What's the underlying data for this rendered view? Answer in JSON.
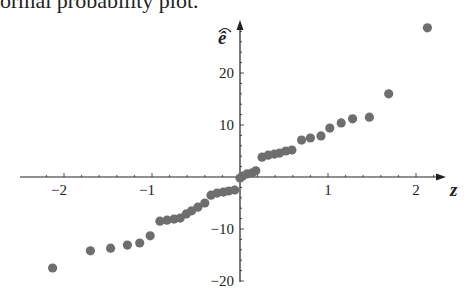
{
  "caption": "ormal probability plot.",
  "colors": {
    "axis": "#222222",
    "point": "#6e6e6e",
    "text": "#222222"
  },
  "chart_data": {
    "type": "scatter",
    "title": "",
    "xlabel": "z",
    "ylabel": "ê",
    "xlim": [
      -2.3,
      2.4
    ],
    "ylim": [
      -20,
      32
    ],
    "xticks": [
      -2,
      -1,
      1,
      2
    ],
    "xtick_labels": [
      "−2",
      "−1",
      "1",
      "2"
    ],
    "yticks": [
      20,
      10,
      -10,
      -20
    ],
    "ytick_labels": [
      "20",
      "10",
      "−10",
      "−20"
    ],
    "grid": false,
    "legend": null,
    "x": [
      -2.13,
      -1.7,
      -1.47,
      -1.28,
      -1.14,
      -1.02,
      -0.91,
      -0.83,
      -0.75,
      -0.68,
      -0.61,
      -0.55,
      -0.48,
      -0.4,
      -0.33,
      -0.26,
      -0.19,
      -0.13,
      -0.06,
      0.0,
      0.03,
      0.08,
      0.14,
      0.18,
      0.25,
      0.32,
      0.39,
      0.45,
      0.52,
      0.59,
      0.7,
      0.8,
      0.92,
      1.02,
      1.15,
      1.28,
      1.47,
      1.69,
      2.13
    ],
    "y": [
      -17.5,
      -14.2,
      -13.7,
      -13.1,
      -12.7,
      -11.3,
      -8.5,
      -8.3,
      -8.1,
      -7.9,
      -7.1,
      -6.5,
      -5.8,
      -5.0,
      -3.5,
      -3.1,
      -2.9,
      -2.7,
      -2.5,
      -0.2,
      0.2,
      0.6,
      0.8,
      1.2,
      3.8,
      4.2,
      4.4,
      4.6,
      5.0,
      5.2,
      7.1,
      7.5,
      7.9,
      9.4,
      10.4,
      11.2,
      11.5,
      16.0,
      28.7
    ]
  }
}
